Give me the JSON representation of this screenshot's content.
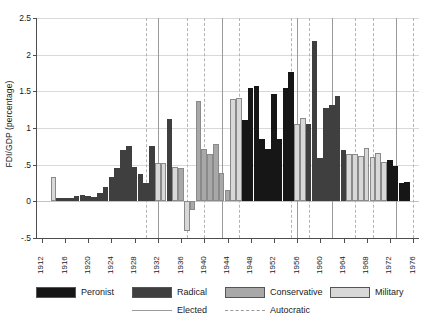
{
  "chart_data": {
    "type": "bar",
    "title": "",
    "xlabel": "",
    "ylabel": "FDI/GDP (percentage)",
    "ylim": [
      -0.5,
      2.5
    ],
    "xlim": [
      1911,
      1977
    ],
    "yticks": [
      -0.5,
      0,
      0.5,
      1,
      1.5,
      2,
      2.5
    ],
    "ytick_labels": [
      "-.5",
      "0",
      ".5",
      "1",
      "1.5",
      "2",
      "2.5"
    ],
    "xticks": [
      1912,
      1916,
      1920,
      1924,
      1928,
      1932,
      1936,
      1940,
      1944,
      1948,
      1952,
      1956,
      1960,
      1964,
      1968,
      1972,
      1976
    ],
    "xtick_labels": [
      "1912",
      "1916",
      "1920",
      "1924",
      "1928",
      "1932",
      "1936",
      "1940",
      "1944",
      "1948",
      "1952",
      "1956",
      "1960",
      "1964",
      "1968",
      "1972",
      "1976"
    ],
    "grid": "horizontal",
    "legend_position": "below",
    "series_colors": {
      "Peronist": "#161616",
      "Radical": "#3f3f3f",
      "Conservative": "#a8a8a8",
      "Military": "#d8d8d8"
    },
    "categories": [
      1914,
      1915,
      1916,
      1917,
      1918,
      1919,
      1920,
      1921,
      1922,
      1923,
      1924,
      1925,
      1926,
      1927,
      1928,
      1929,
      1930,
      1931,
      1932,
      1933,
      1934,
      1935,
      1936,
      1937,
      1938,
      1939,
      1940,
      1941,
      1942,
      1943,
      1944,
      1945,
      1946,
      1947,
      1948,
      1949,
      1950,
      1951,
      1952,
      1953,
      1954,
      1955,
      1956,
      1957,
      1958,
      1959,
      1960,
      1961,
      1962,
      1963,
      1964,
      1965,
      1966,
      1967,
      1968,
      1969,
      1970,
      1971,
      1972,
      1973,
      1974,
      1975
    ],
    "values": [
      0.33,
      0.05,
      0.05,
      0.04,
      0.07,
      0.09,
      0.07,
      0.06,
      0.11,
      0.19,
      0.33,
      0.45,
      0.7,
      0.76,
      0.47,
      0.37,
      0.25,
      0.75,
      0.52,
      0.52,
      1.12,
      0.47,
      0.46,
      -0.4,
      -0.12,
      1.37,
      0.72,
      0.64,
      0.78,
      0.39,
      0.15,
      1.4,
      1.41,
      1.11,
      1.55,
      1.57,
      0.85,
      0.72,
      1.47,
      0.85,
      1.55,
      1.77,
      1.05,
      1.14,
      1.05,
      2.19,
      0.59,
      1.27,
      1.32,
      1.43,
      0.7,
      0.65,
      0.64,
      0.62,
      0.73,
      0.6,
      0.66,
      0.53,
      0.56,
      0.48,
      0.25,
      0.26
    ],
    "party_by_year": [
      "Military",
      "Radical",
      "Radical",
      "Radical",
      "Radical",
      "Radical",
      "Radical",
      "Radical",
      "Radical",
      "Radical",
      "Radical",
      "Radical",
      "Radical",
      "Radical",
      "Radical",
      "Radical",
      "Radical",
      "Radical",
      "Military",
      "Military",
      "Radical",
      "Military",
      "Conservative",
      "Military",
      "Conservative",
      "Conservative",
      "Conservative",
      "Conservative",
      "Conservative",
      "Conservative",
      "Conservative",
      "Military",
      "Military",
      "Peronist",
      "Peronist",
      "Peronist",
      "Peronist",
      "Peronist",
      "Peronist",
      "Peronist",
      "Peronist",
      "Peronist",
      "Military",
      "Military",
      "Radical",
      "Radical",
      "Radical",
      "Radical",
      "Radical",
      "Radical",
      "Radical",
      "Military",
      "Military",
      "Military",
      "Military",
      "Military",
      "Military",
      "Military",
      "Peronist",
      "Peronist",
      "Peronist",
      "Peronist"
    ],
    "regime_lines": [
      {
        "year": 1930,
        "type": "autocratic"
      },
      {
        "year": 1932,
        "type": "elected"
      },
      {
        "year": 1937,
        "type": "autocratic"
      },
      {
        "year": 1940,
        "type": "autocratic"
      },
      {
        "year": 1943,
        "type": "elected"
      },
      {
        "year": 1946,
        "type": "autocratic"
      },
      {
        "year": 1955,
        "type": "autocratic"
      },
      {
        "year": 1956,
        "type": "elected"
      },
      {
        "year": 1958,
        "type": "autocratic"
      },
      {
        "year": 1962,
        "type": "elected"
      },
      {
        "year": 1966,
        "type": "autocratic"
      },
      {
        "year": 1969,
        "type": "autocratic"
      },
      {
        "year": 1973,
        "type": "elected"
      },
      {
        "year": 1976,
        "type": "autocratic"
      }
    ]
  },
  "legend": {
    "parties": [
      {
        "label": "Peronist",
        "color": "#161616"
      },
      {
        "label": "Radical",
        "color": "#3f3f3f"
      },
      {
        "label": "Conservative",
        "color": "#a8a8a8"
      },
      {
        "label": "Military",
        "color": "#d8d8d8"
      }
    ],
    "regimes": [
      {
        "label": "Elected",
        "style": "solid"
      },
      {
        "label": "Autocratic",
        "style": "dashed"
      }
    ]
  }
}
